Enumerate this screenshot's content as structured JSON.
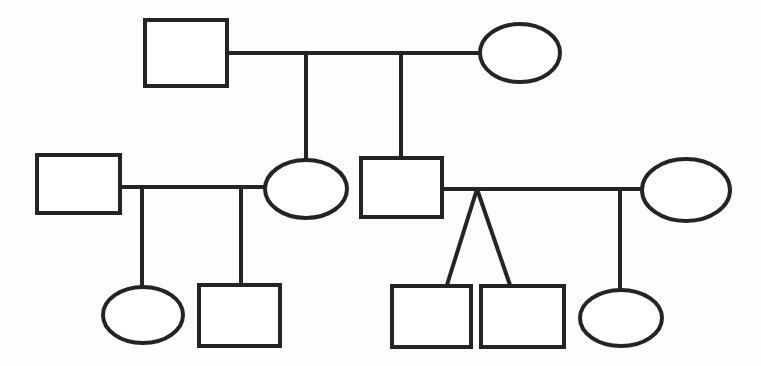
{
  "diagram": {
    "type": "pedigree-genogram",
    "canvas": {
      "width": 761,
      "height": 366,
      "background": "#fdfdfd"
    },
    "stroke_color": "#242424",
    "stroke_width": 4,
    "generations": 3,
    "legend": {
      "square_meaning": "male",
      "ellipse_meaning": "female",
      "horizontal_line_meaning": "partnership",
      "vertical_line_meaning": "descent",
      "v_shape_meaning": "twins"
    }
  },
  "nodes": [
    {
      "id": "g1-male",
      "label": "",
      "shape": "square",
      "sex": "male",
      "generation": 1,
      "x": 145,
      "y": 20,
      "width": 82,
      "height": 66
    },
    {
      "id": "g1-female",
      "label": "",
      "shape": "ellipse",
      "sex": "female",
      "generation": 1,
      "cx": 520,
      "cy": 53,
      "rx": 40,
      "ry": 29
    },
    {
      "id": "g2-male-left",
      "label": "",
      "shape": "square",
      "sex": "male",
      "generation": 2,
      "x": 37,
      "y": 155,
      "width": 83,
      "height": 58
    },
    {
      "id": "g2-female-left",
      "label": "",
      "shape": "ellipse",
      "sex": "female",
      "generation": 2,
      "cx": 306,
      "cy": 189,
      "rx": 41,
      "ry": 29
    },
    {
      "id": "g2-male-right",
      "label": "",
      "shape": "square",
      "sex": "male",
      "generation": 2,
      "x": 361,
      "y": 158,
      "width": 81,
      "height": 59
    },
    {
      "id": "g2-female-right",
      "label": "",
      "shape": "ellipse",
      "sex": "female",
      "generation": 2,
      "cx": 686,
      "cy": 190,
      "rx": 44,
      "ry": 31
    },
    {
      "id": "g3-female-a",
      "label": "",
      "shape": "ellipse",
      "sex": "female",
      "generation": 3,
      "cx": 143,
      "cy": 315,
      "rx": 40,
      "ry": 28
    },
    {
      "id": "g3-male-a",
      "label": "",
      "shape": "square",
      "sex": "male",
      "generation": 3,
      "x": 199,
      "y": 285,
      "width": 81,
      "height": 61
    },
    {
      "id": "g3-male-twin-1",
      "label": "",
      "shape": "square",
      "sex": "male",
      "generation": 3,
      "x": 392,
      "y": 286,
      "width": 79,
      "height": 61
    },
    {
      "id": "g3-male-twin-2",
      "label": "",
      "shape": "square",
      "sex": "male",
      "generation": 3,
      "x": 481,
      "y": 286,
      "width": 83,
      "height": 61
    },
    {
      "id": "g3-female-b",
      "label": "",
      "shape": "ellipse",
      "sex": "female",
      "generation": 3,
      "cx": 621,
      "cy": 318,
      "rx": 41,
      "ry": 28
    }
  ],
  "edges": [
    {
      "id": "union-g1",
      "kind": "partnership",
      "from": "g1-male",
      "to": "g1-female",
      "x1": 227,
      "y1": 53,
      "x2": 480,
      "y2": 53
    },
    {
      "id": "descent-g1-to-g2-female-left",
      "kind": "descent",
      "from": "union-g1",
      "to": "g2-female-left",
      "x1": 306,
      "y1": 53,
      "x2": 306,
      "y2": 161
    },
    {
      "id": "descent-g1-to-g2-male-right",
      "kind": "descent",
      "from": "union-g1",
      "to": "g2-male-right",
      "x1": 401,
      "y1": 53,
      "x2": 401,
      "y2": 158
    },
    {
      "id": "union-g2-left",
      "kind": "partnership",
      "from": "g2-male-left",
      "to": "g2-female-left",
      "x1": 120,
      "y1": 187,
      "x2": 266,
      "y2": 187
    },
    {
      "id": "descent-g2-left-to-g3-female-a",
      "kind": "descent",
      "from": "union-g2-left",
      "to": "g3-female-a",
      "x1": 142,
      "y1": 187,
      "x2": 142,
      "y2": 288
    },
    {
      "id": "descent-g2-left-to-g3-male-a",
      "kind": "descent",
      "from": "union-g2-left",
      "to": "g3-male-a",
      "x1": 241,
      "y1": 187,
      "x2": 241,
      "y2": 285
    },
    {
      "id": "union-g2-right",
      "kind": "partnership",
      "from": "g2-male-right",
      "to": "g2-female-right",
      "x1": 442,
      "y1": 189,
      "x2": 643,
      "y2": 189
    },
    {
      "id": "twin-fork-left",
      "kind": "twin",
      "from": "union-g2-right",
      "to": "g3-male-twin-1",
      "x1": 477,
      "y1": 189,
      "x2": 446,
      "y2": 287
    },
    {
      "id": "twin-fork-right",
      "kind": "twin",
      "from": "union-g2-right",
      "to": "g3-male-twin-2",
      "x1": 477,
      "y1": 189,
      "x2": 511,
      "y2": 287
    },
    {
      "id": "descent-g2-right-to-g3-female-b",
      "kind": "descent",
      "from": "union-g2-right",
      "to": "g3-female-b",
      "x1": 620,
      "y1": 189,
      "x2": 620,
      "y2": 291
    }
  ]
}
